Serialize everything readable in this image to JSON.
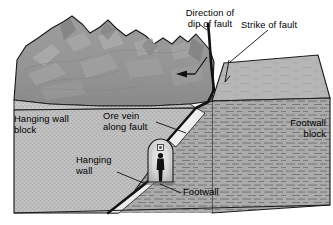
{
  "diagram": {
    "labels": {
      "dip_direction": "Direction of\ndip of fault",
      "strike": "Strike of fault",
      "hanging_wall_block": "Hanging wall\nblock",
      "ore_vein": "Ore vein\nalong fault",
      "footwall_block": "Footwall\nblock",
      "hanging_wall": "Hanging\nwall",
      "footwall": "Footwall"
    },
    "features": {
      "mountain": "mountain-terrain",
      "plateau": "right-plateau-surface",
      "fault_line": "fault-plane-trace",
      "ore_vein_band": "ore-vein-white-wedge",
      "mine_tunnel": "mine-adit-opening",
      "miner": "miner-silhouette",
      "lamp": "mine-lamp",
      "dip_arrow": "dip-direction-arrow",
      "strike_tick": "strike-tick-mark"
    },
    "colors": {
      "outline": "#1a1a1a",
      "mountain_fill": "#969696",
      "mountain_highlight": "#b0b0b0",
      "mountain_shadow": "#7e7e7e",
      "plateau_fill": "#b4b4b4",
      "hanging_wall_fill": "#c2c2c2",
      "footwall_fill": "#a8a8a8",
      "strata_line": "#6e6e6e",
      "ore_vein_fill": "#f2f2f2",
      "tunnel_fill": "#d8d8d8",
      "figure_fill": "#121212",
      "background": "#ffffff",
      "label_text": "#000000"
    }
  }
}
